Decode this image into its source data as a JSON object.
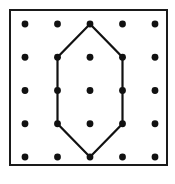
{
  "figure": {
    "background_color": "#ffffff",
    "frame": {
      "name": "geoboard-frame",
      "x": 10,
      "y": 10,
      "width": 157,
      "height": 155,
      "stroke_color": "#1a1a1a",
      "stroke_width": 2,
      "fill_color": "#ffffff"
    },
    "grid": {
      "rows": 5,
      "columns": 5,
      "origin_x": 25,
      "origin_y": 24,
      "spacing_x": 32.5,
      "spacing_y": 33.25,
      "dot_radius": 3.4,
      "dot_color": "#111111"
    }
  },
  "chart_data": {
    "type": "scatter",
    "xlabel": "",
    "ylabel": "",
    "xlim": [
      1,
      5
    ],
    "ylim": [
      1,
      5
    ],
    "grid": false,
    "legend": "none",
    "categories": [
      "col1",
      "col2",
      "col3",
      "col4",
      "col5"
    ],
    "pegs": [
      {
        "col": 1,
        "row": 1
      },
      {
        "col": 2,
        "row": 1
      },
      {
        "col": 3,
        "row": 1
      },
      {
        "col": 4,
        "row": 1
      },
      {
        "col": 5,
        "row": 1
      },
      {
        "col": 1,
        "row": 2
      },
      {
        "col": 2,
        "row": 2
      },
      {
        "col": 3,
        "row": 2
      },
      {
        "col": 4,
        "row": 2
      },
      {
        "col": 5,
        "row": 2
      },
      {
        "col": 1,
        "row": 3
      },
      {
        "col": 2,
        "row": 3
      },
      {
        "col": 3,
        "row": 3
      },
      {
        "col": 4,
        "row": 3
      },
      {
        "col": 5,
        "row": 3
      },
      {
        "col": 1,
        "row": 4
      },
      {
        "col": 2,
        "row": 4
      },
      {
        "col": 3,
        "row": 4
      },
      {
        "col": 4,
        "row": 4
      },
      {
        "col": 5,
        "row": 4
      },
      {
        "col": 1,
        "row": 5
      },
      {
        "col": 2,
        "row": 5
      },
      {
        "col": 3,
        "row": 5
      },
      {
        "col": 4,
        "row": 5
      },
      {
        "col": 5,
        "row": 5
      }
    ],
    "shapes": [
      {
        "name": "hexagon",
        "sides": 6,
        "closed": true,
        "stroke_color": "#111111",
        "fill": "none",
        "vertices": [
          {
            "col": 3,
            "row": 1
          },
          {
            "col": 4,
            "row": 2
          },
          {
            "col": 4,
            "row": 4
          },
          {
            "col": 3,
            "row": 5
          },
          {
            "col": 2,
            "row": 4
          },
          {
            "col": 2,
            "row": 2
          }
        ]
      }
    ]
  }
}
